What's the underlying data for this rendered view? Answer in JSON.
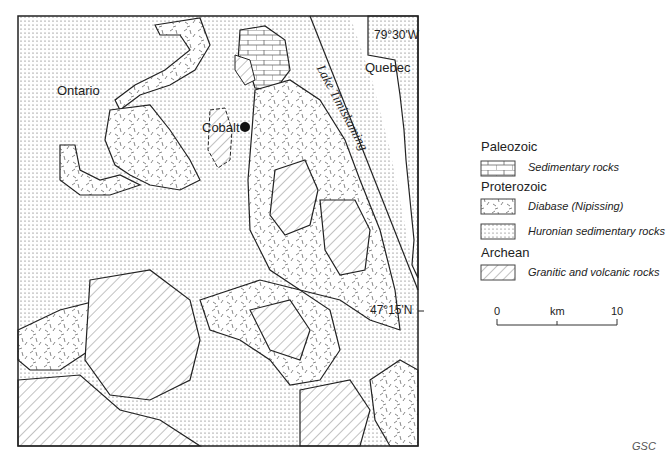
{
  "map": {
    "labels": {
      "ontario": "Ontario",
      "quebec": "Quebec",
      "cobalt": "Cobalt",
      "lake": "Lake Timiskaming",
      "longitude": "79°30'W",
      "latitude": "47°15'N"
    }
  },
  "legend": {
    "groups": [
      {
        "title": "Paleozoic",
        "items": [
          {
            "pattern": "brick",
            "label": "Sedimentary rocks"
          }
        ]
      },
      {
        "title": "Proterozoic",
        "items": [
          {
            "pattern": "dash",
            "label": "Diabase (Nipissing)"
          },
          {
            "pattern": "dots",
            "label": "Huronian sedimentary rocks"
          }
        ]
      },
      {
        "title": "Archean",
        "items": [
          {
            "pattern": "hatch",
            "label": "Granitic and volcanic rocks"
          }
        ]
      }
    ]
  },
  "scale": {
    "start": "0",
    "unit": "km",
    "end": "10"
  },
  "credit": "GSC"
}
